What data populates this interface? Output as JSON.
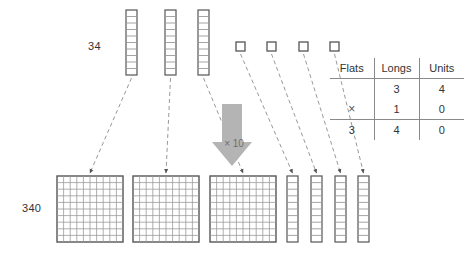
{
  "diagram": {
    "title_labels": {
      "top_number": "34",
      "bottom_number": "340"
    },
    "multiplier_arrow": {
      "label": "× 10",
      "color": "#b4b4b4",
      "text_color": "#6e6e6e",
      "direction": "down"
    },
    "top_row": {
      "longs_count": 3,
      "long_cells": 10,
      "units_count": 4,
      "description_value": "34"
    },
    "bottom_row": {
      "flats_count": 3,
      "flat_grid_rows": 10,
      "flat_grid_cols": 10,
      "longs_count": 4,
      "long_cells": 10,
      "description_value": "340"
    },
    "stroke_color": "#555555",
    "grid_color": "#9a9a9a",
    "dash_color": "#999999"
  },
  "table": {
    "headers": [
      "Flats",
      "Longs",
      "Units"
    ],
    "rows": [
      {
        "name": "factor-row",
        "cells": [
          "",
          "3",
          "4"
        ]
      },
      {
        "name": "operator-row",
        "cells": [
          "×",
          "1",
          "0"
        ]
      },
      {
        "name": "product-row",
        "cells": [
          "3",
          "4",
          "0"
        ]
      }
    ],
    "rule_color": "#8a8a8a"
  }
}
